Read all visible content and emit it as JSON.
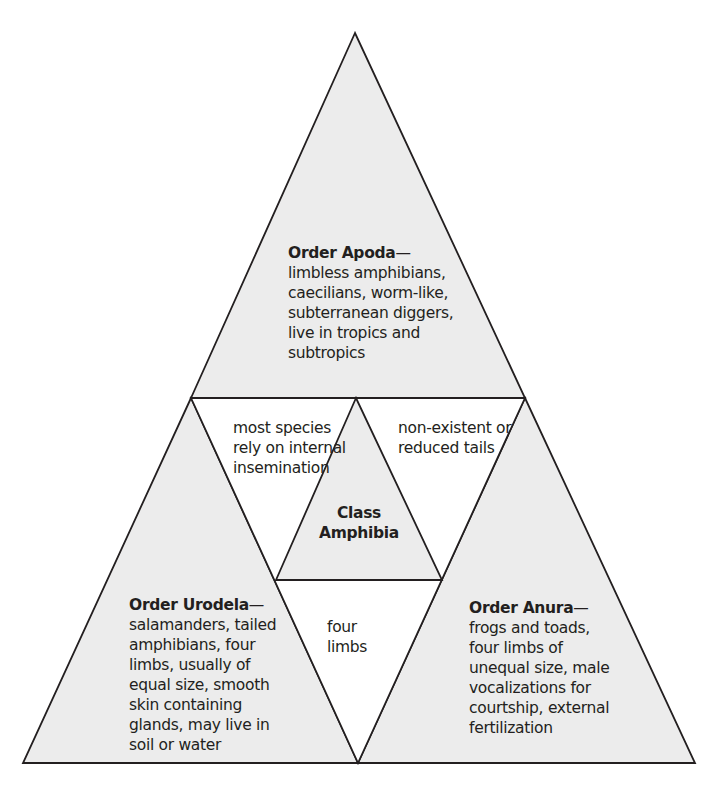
{
  "diagram": {
    "colors": {
      "fill": "#ececec",
      "stroke": "#231f20",
      "text": "#231f20"
    },
    "center": {
      "lines": [
        "Class",
        "Amphibia"
      ]
    },
    "apoda": {
      "title": "Order Apoda",
      "dash": "—",
      "lines": [
        "limbless amphibians,",
        "caecilians, worm-like,",
        "subterranean diggers,",
        "live in tropics and",
        "subtropics"
      ]
    },
    "urodela": {
      "title": "Order Urodela",
      "dash": "—",
      "lines": [
        "salamanders, tailed",
        "amphibians, four",
        "limbs, usually of",
        "equal size, smooth",
        "skin containing",
        "glands, may live in",
        "soil or water"
      ]
    },
    "anura": {
      "title": "Order Anura",
      "dash": "—",
      "lines": [
        "frogs and toads,",
        "four limbs of",
        "unequal size, male",
        "vocalizations for",
        "courtship, external",
        "fertilization"
      ]
    },
    "shared_apoda_urodela": {
      "lines": [
        "most species",
        "rely on internal",
        "insemination"
      ]
    },
    "shared_apoda_anura": {
      "lines": [
        "non-existent or",
        "reduced tails"
      ]
    },
    "shared_urodela_anura": {
      "lines": [
        "four",
        "limbs"
      ]
    }
  }
}
